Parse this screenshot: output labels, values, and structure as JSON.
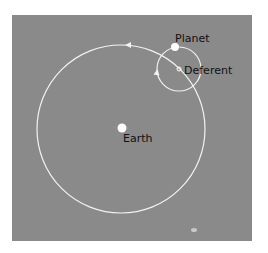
{
  "diagram": {
    "type": "ptolemaic-epicycle",
    "labels": {
      "planet": "Planet",
      "deferent": "Deferent",
      "earth": "Earth"
    },
    "colors": {
      "background": "#8a8a8a",
      "lines": "#f2f2f2",
      "text": "#111111"
    }
  }
}
